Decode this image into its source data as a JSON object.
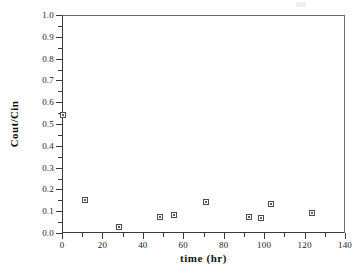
{
  "chart_data": {
    "type": "scatter",
    "title": "",
    "xlabel": "time (hr)",
    "ylabel": "Cout/Cin",
    "xlim": [
      0,
      140
    ],
    "ylim": [
      0,
      1.0
    ],
    "grid": false,
    "legend": null,
    "x_ticks": [
      0,
      20,
      40,
      60,
      80,
      100,
      120,
      140
    ],
    "x_tick_labels": [
      "0",
      "20",
      "40",
      "60",
      "80",
      "100",
      "120",
      "140"
    ],
    "x_minor_interval": 10,
    "y_ticks": [
      0.0,
      0.1,
      0.2,
      0.3,
      0.4,
      0.5,
      0.6,
      0.7,
      0.8,
      0.9,
      1.0
    ],
    "y_tick_labels": [
      "0.0",
      "0.1",
      "0.2",
      "0.3",
      "0.4",
      "0.5",
      "0.6",
      "0.7",
      "0.8",
      "0.9",
      "1.0"
    ],
    "y_minor_interval": 0.05,
    "marker": "open-square",
    "marker_color": "#4a4a4a",
    "series": [
      {
        "name": "Cout/Cin",
        "points": [
          {
            "x": 0.5,
            "y": 0.54
          },
          {
            "x": 11.4,
            "y": 0.15
          },
          {
            "x": 28.2,
            "y": 0.027
          },
          {
            "x": 48.5,
            "y": 0.073
          },
          {
            "x": 55.4,
            "y": 0.082
          },
          {
            "x": 71.2,
            "y": 0.14
          },
          {
            "x": 92.5,
            "y": 0.075
          },
          {
            "x": 98.4,
            "y": 0.069
          },
          {
            "x": 103.4,
            "y": 0.135
          },
          {
            "x": 123.6,
            "y": 0.092
          }
        ]
      }
    ]
  }
}
